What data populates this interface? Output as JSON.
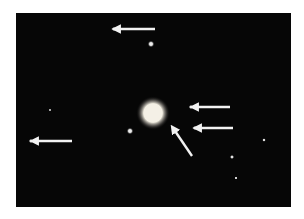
{
  "image": {
    "subject": "astronomical photograph of a planet with satellites indicated by arrows",
    "background_color": "#060606",
    "frame": {
      "x": 16,
      "y": 13,
      "width": 275,
      "height": 194
    }
  },
  "planet": {
    "cx": 153,
    "cy": 113,
    "r": 10,
    "color": "#f4f0e6"
  },
  "marked_satellites": [
    {
      "id": "satellite-1",
      "cx": 114,
      "cy": 29,
      "arrow": {
        "x1": 155,
        "y1": 29,
        "x2": 119,
        "y2": 29
      }
    },
    {
      "id": "satellite-2",
      "cx": 191,
      "cy": 107,
      "arrow": {
        "x1": 230,
        "y1": 107,
        "x2": 197,
        "y2": 107
      }
    },
    {
      "id": "satellite-3",
      "cx": 195,
      "cy": 128,
      "arrow": {
        "x1": 233,
        "y1": 128,
        "x2": 200,
        "y2": 128
      }
    },
    {
      "id": "satellite-4",
      "cx": 31,
      "cy": 141,
      "arrow": {
        "x1": 72,
        "y1": 141,
        "x2": 37,
        "y2": 141
      }
    },
    {
      "id": "satellite-5-near-planet",
      "cx": 172,
      "cy": 126,
      "arrow": {
        "x1": 192,
        "y1": 156,
        "x2": 175,
        "y2": 131
      }
    }
  ],
  "background_stars": [
    {
      "cx": 151,
      "cy": 44,
      "r": 2.2
    },
    {
      "cx": 130,
      "cy": 131,
      "r": 2.2
    },
    {
      "cx": 232,
      "cy": 157,
      "r": 1.4
    },
    {
      "cx": 264,
      "cy": 140,
      "r": 1.2
    },
    {
      "cx": 236,
      "cy": 178,
      "r": 0.9
    },
    {
      "cx": 50,
      "cy": 110,
      "r": 0.8
    }
  ],
  "arrow_color": "#f2f2f2"
}
